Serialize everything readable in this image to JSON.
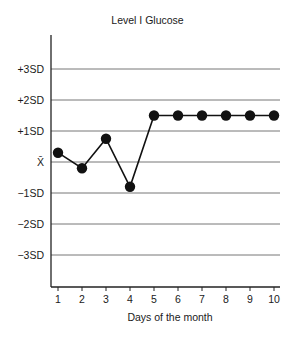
{
  "chart_data": {
    "type": "line",
    "title": "Level I Glucose",
    "xlabel": "Days of the month",
    "ylabel": "",
    "x": [
      1,
      2,
      3,
      4,
      5,
      6,
      7,
      8,
      9,
      10
    ],
    "series": [
      {
        "name": "Level I Glucose (SD from mean)",
        "values": [
          0.3,
          -0.2,
          0.75,
          -0.8,
          1.5,
          1.5,
          1.5,
          1.5,
          1.5,
          1.5
        ]
      }
    ],
    "y_tick_labels": [
      "+3SD",
      "+2SD",
      "+1SD",
      "X̄",
      "−1SD",
      "−2SD",
      "−3SD"
    ],
    "y_tick_values": [
      3,
      2,
      1,
      0,
      -1,
      -2,
      -3
    ],
    "ylim": [
      -4.1,
      4.1
    ],
    "xlim": [
      0.75,
      10.25
    ],
    "grid": "horizontal lines at each SD level",
    "legend": "none"
  },
  "labels": {
    "title": "Level I Glucose",
    "xlabel": "Days of the month"
  },
  "colors": {
    "line": "#111111",
    "grid": "#777777",
    "axis": "#222222"
  }
}
